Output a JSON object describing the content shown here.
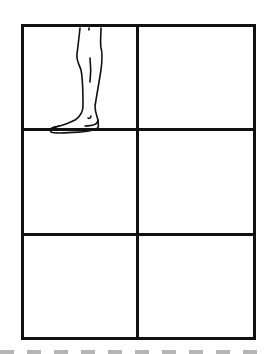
{
  "diagram": {
    "type": "grid-panel-layout",
    "rows": 3,
    "columns": 2,
    "line_color": "#111111",
    "background": "#ffffff",
    "cells": [
      {
        "row": 1,
        "col": 1,
        "content": "leg-and-foot-sketch"
      },
      {
        "row": 1,
        "col": 2,
        "content": "empty"
      },
      {
        "row": 2,
        "col": 1,
        "content": "empty"
      },
      {
        "row": 2,
        "col": 2,
        "content": "empty"
      },
      {
        "row": 3,
        "col": 1,
        "content": "empty"
      },
      {
        "row": 3,
        "col": 2,
        "content": "empty"
      }
    ],
    "separator": {
      "style": "dashed",
      "color": "#b5b5b5"
    }
  }
}
